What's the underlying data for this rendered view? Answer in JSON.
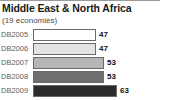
{
  "chart_data": {
    "type": "bar",
    "title": "Middle East & North Africa",
    "subtitle": "(19 economies)",
    "orientation": "horizontal",
    "xlabel": "",
    "ylabel": "",
    "grid": false,
    "legend": null,
    "xlim": [
      0,
      80
    ],
    "categories": [
      "DB2005",
      "DB2006",
      "DB2007",
      "DB2008",
      "DB2009"
    ],
    "values": [
      47,
      47,
      53,
      53,
      63
    ],
    "value_labels": [
      "47",
      "47",
      "53",
      "53",
      "63"
    ],
    "bar_colors": [
      "#ffffff",
      "#e2e2e2",
      "#b6b6b6",
      "#6f6f6f",
      "#2b2b2b"
    ],
    "bar_border_color": "#6b6b6b",
    "series": [
      {
        "name": "Reforms",
        "values": [
          47,
          47,
          53,
          53,
          63
        ]
      }
    ],
    "points": [
      {
        "category": "DB2005",
        "value": 47,
        "label": "47",
        "color": "#ffffff"
      },
      {
        "category": "DB2006",
        "value": 47,
        "label": "47",
        "color": "#e2e2e2"
      },
      {
        "category": "DB2007",
        "value": 53,
        "label": "53",
        "color": "#b6b6b6"
      },
      {
        "category": "DB2008",
        "value": 53,
        "label": "53",
        "color": "#6f6f6f"
      },
      {
        "category": "DB2009",
        "value": 63,
        "label": "63",
        "color": "#2b2b2b"
      }
    ]
  },
  "colors": {
    "title_text": "#1a1a1a",
    "subtitle_text": "#4a4a4a",
    "category_text": "#5d5d5d",
    "value_text": "#111111",
    "rule": "#9a9a9a",
    "background": "#ffffff"
  }
}
